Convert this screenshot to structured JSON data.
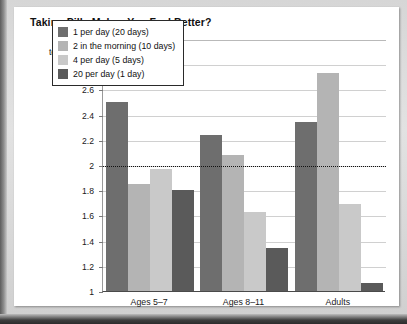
{
  "card": {
    "title": "Taking Pills Makes You Feel Better?",
    "axis_note_line1": "1 = Worse",
    "axis_note_line2": "to 3 = Better"
  },
  "chart_data": {
    "type": "bar",
    "title": "Taking Pills Makes You Feel Better?",
    "xlabel": "",
    "ylabel": "",
    "ylim": [
      1,
      3
    ],
    "yticks": [
      "1",
      "1.2",
      "1.4",
      "1.6",
      "1.8",
      "2",
      "2.2",
      "2.4",
      "2.6",
      "2.8",
      "3"
    ],
    "grid": true,
    "legend_position": "top-center-inside",
    "reference_line": {
      "value": 2,
      "style": "dotted",
      "color": "#111111"
    },
    "categories": [
      "Ages 5–7",
      "Ages 8–11",
      "Adults"
    ],
    "series": [
      {
        "name": "1 per day (20 days)",
        "color": "#6e6e6e",
        "values": [
          2.5,
          2.24,
          2.34
        ]
      },
      {
        "name": "2 in the morning (10 days)",
        "color": "#b4b4b4",
        "values": [
          1.85,
          2.08,
          2.73
        ]
      },
      {
        "name": "4 per day (5 days)",
        "color": "#c9c9c9",
        "values": [
          1.97,
          1.63,
          1.69
        ]
      },
      {
        "name": "20 per day (1 day)",
        "color": "#5a5a5a",
        "values": [
          1.8,
          1.34,
          1.06
        ]
      }
    ]
  }
}
